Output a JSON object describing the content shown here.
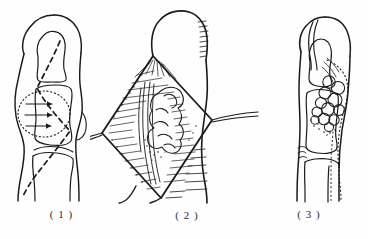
{
  "figure": {
    "kind": "line-drawing",
    "background_color": "#fefefe",
    "ink_color": "#1a1a1a",
    "panel_count": 3
  },
  "panels": [
    {
      "id": "panel-1",
      "caption": "( 1 )",
      "title": "preoperative-lateral-finger-with-planned-incision",
      "features": [
        "finger-outline-lateral-view",
        "distal-phalanx-bone-outline",
        "middle-phalanx-bone-outline",
        "proximal-phalanx-bone-outline",
        "dotted-oval-lesion-volar-aspect",
        "three-arrows-pointing-at-lesion",
        "dashed-oblique-incision-line"
      ],
      "arrow_count": 3
    },
    {
      "id": "panel-2",
      "caption": "( 2 )",
      "title": "intraoperative-rhomboid-flap-exposure-with-retractors",
      "features": [
        "finger-outline-volar-view",
        "rhomboid-diamond-shaped-skin-flap",
        "hatched-subcutaneous-tissue-shading",
        "lobulated-tumor-mass-exposed",
        "flexor-tendon-fibers",
        "left-retractor-suture",
        "right-retractor-suture",
        "skin-crease-lines"
      ],
      "retractor_count": 2
    },
    {
      "id": "panel-3",
      "caption": "( 3 )",
      "title": "lateral-view-showing-lobulated-tumor-extent",
      "features": [
        "finger-outline-lateral-view",
        "distal-phalanx-bone-outline",
        "middle-phalanx-bone-outline",
        "proximal-phalanx-bone-outline",
        "lobulated-tumor-nodule-cluster",
        "dotted-tumor-extent-contour",
        "joint-crease-marks"
      ],
      "lobule_count": 12
    }
  ]
}
